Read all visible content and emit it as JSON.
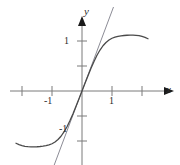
{
  "figure": {
    "name": "function-graph-with-tangent-line",
    "background_color": "#ffffff",
    "width": 180,
    "height": 165
  },
  "axes": {
    "x_axis_label": "x",
    "y_axis_label": "y",
    "origin_px": [
      82,
      91
    ],
    "x_unit_px": 30,
    "y_unit_px": 50,
    "axis_color": "#6b6b6b",
    "arrow_color": "#1a1a1a",
    "x_tick_labels": [
      "-1",
      "1"
    ],
    "y_tick_labels": [
      "1",
      "-1"
    ],
    "x_ticks_values": [
      -2,
      -1,
      1,
      2
    ],
    "y_ticks_values": [
      1,
      0.5,
      -0.5,
      -1
    ],
    "xlim": [
      -2.4,
      2.9
    ],
    "ylim": [
      -1.8,
      1.48
    ]
  },
  "chart_data": {
    "type": "line",
    "title": "",
    "xlabel": "x",
    "ylabel": "y",
    "xlim": [
      -2.4,
      2.9
    ],
    "ylim": [
      -1.8,
      1.48
    ],
    "grid": false,
    "legend": "none",
    "series": [
      {
        "name": "curve",
        "description": "odd sine-like curve with maximum near x=1.35 and minimum near x=-1.35",
        "color": "#4a4a4a",
        "line_width": 1.3,
        "x": [
          -2.2,
          -2.1,
          -2.0,
          -1.9,
          -1.8,
          -1.7,
          -1.6,
          -1.5,
          -1.4,
          -1.3,
          -1.2,
          -1.1,
          -1.0,
          -0.9,
          -0.8,
          -0.7,
          -0.6,
          -0.5,
          -0.4,
          -0.3,
          -0.2,
          -0.1,
          0.0,
          0.1,
          0.2,
          0.3,
          0.4,
          0.5,
          0.6,
          0.7,
          0.8,
          0.9,
          1.0,
          1.1,
          1.2,
          1.3,
          1.4,
          1.5,
          1.6,
          1.7,
          1.8,
          1.9,
          2.0,
          2.1,
          2.2
        ],
        "y": [
          -1.045,
          -1.072,
          -1.092,
          -1.106,
          -1.114,
          -1.118,
          -1.118,
          -1.115,
          -1.11,
          -1.103,
          -1.093,
          -1.078,
          -1.055,
          -1.02,
          -0.971,
          -0.905,
          -0.819,
          -0.714,
          -0.591,
          -0.454,
          -0.307,
          -0.155,
          0.0,
          0.155,
          0.307,
          0.454,
          0.591,
          0.714,
          0.819,
          0.905,
          0.971,
          1.02,
          1.055,
          1.078,
          1.093,
          1.103,
          1.11,
          1.115,
          1.118,
          1.118,
          1.114,
          1.106,
          1.092,
          1.072,
          1.045
        ]
      },
      {
        "name": "tangent-line",
        "description": "straight tangent line through origin, slope approximately 1.60",
        "color": "#8c8c96",
        "line_width": 1.0,
        "slope": 1.6,
        "intercept": 0,
        "x": [
          -1.22,
          1.05
        ],
        "y": [
          -1.95,
          1.68
        ]
      }
    ]
  }
}
